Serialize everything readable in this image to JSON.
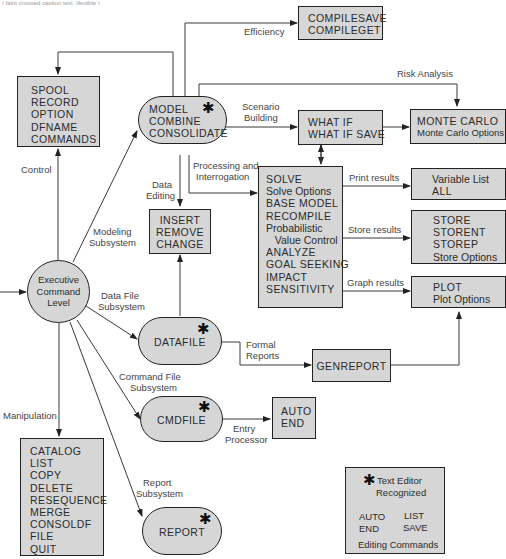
{
  "header_fragment": "( faint cropped caption text, illegible )",
  "nodes": {
    "spool": {
      "lines": [
        "SPOOL",
        "RECORD",
        "OPTION",
        "DFNAME",
        "COMMANDS"
      ]
    },
    "model": {
      "lines": [
        "MODEL",
        "COMBINE",
        "CONSOLIDATE"
      ],
      "star": "✱"
    },
    "compile": {
      "lines": [
        "COMPILESAVE",
        "COMPILEGET"
      ]
    },
    "whatif": {
      "lines": [
        "WHAT IF",
        "WHAT IF SAVE"
      ]
    },
    "montecarlo": {
      "lines": [
        "MONTE CARLO",
        "Monte Carlo Options"
      ]
    },
    "insert": {
      "lines": [
        "INSERT",
        "REMOVE",
        "CHANGE"
      ]
    },
    "solve": {
      "lines": [
        "SOLVE",
        "Solve Options",
        "BASE MODEL",
        "RECOMPILE",
        "Probabilistic",
        "   Value Control",
        "ANALYZE",
        "GOAL SEEKING",
        "IMPACT",
        "SENSITIVITY"
      ]
    },
    "varlist": {
      "lines": [
        "Variable List",
        "ALL"
      ]
    },
    "store": {
      "lines": [
        "STORE",
        "STORENT",
        "STOREP",
        "Store Options"
      ]
    },
    "plot": {
      "lines": [
        "PLOT",
        "Plot Options"
      ]
    },
    "executive": {
      "lines": [
        "Executive",
        "Command",
        "Level"
      ]
    },
    "datafile": {
      "lines": [
        "DATAFILE"
      ],
      "star": "✱"
    },
    "genreport": {
      "lines": [
        "GENREPORT"
      ]
    },
    "cmdfile": {
      "lines": [
        "CMDFILE"
      ],
      "star": "✱"
    },
    "autoend": {
      "lines": [
        "AUTO",
        "END"
      ]
    },
    "catalog": {
      "lines": [
        "CATALOG",
        "LIST",
        "COPY",
        "DELETE",
        "RESEQUENCE",
        "MERGE",
        "CONSOLDF",
        "FILE",
        "QUIT"
      ]
    },
    "report": {
      "lines": [
        "REPORT"
      ],
      "star": "✱"
    }
  },
  "edge_labels": {
    "efficiency": "Efficiency",
    "risk_analysis": "Risk Analysis",
    "scenario": [
      "Scenario",
      "Building"
    ],
    "control": "Control",
    "processing": [
      "Processing and",
      "Interrogation"
    ],
    "data_editing": [
      "Data",
      "Editing"
    ],
    "print_results": "Print results",
    "store_results": "Store results",
    "graph_results": "Graph results",
    "modeling": [
      "Modeling",
      "Subsystem"
    ],
    "data_file": [
      "Data File",
      "Subsystem"
    ],
    "formal_reports": [
      "Formal",
      "Reports"
    ],
    "command_file": [
      "Command File",
      "Subsystem"
    ],
    "entry_processor": [
      "Entry",
      "Processor"
    ],
    "manipulation": "Manipulation",
    "report_subsystem": [
      "Report",
      "Subsystem"
    ]
  },
  "legend": {
    "star": "✱",
    "title_1": "Text Editor",
    "title_2": "Recognized",
    "col1": [
      "AUTO",
      "END"
    ],
    "col2": [
      "LIST",
      "SAVE"
    ],
    "caption": "Editing Commands"
  },
  "colors": {
    "node_fill": "#d6d6d6",
    "stroke": "#222222",
    "label_text": "#444444"
  }
}
